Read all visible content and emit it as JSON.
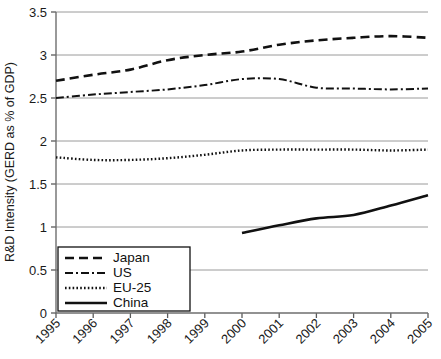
{
  "chart_data": {
    "type": "line",
    "title": "",
    "xlabel": "",
    "ylabel": "R&D Intensity (GERD as % of GDP)",
    "x": [
      1995,
      1996,
      1997,
      1998,
      1999,
      2000,
      2001,
      2002,
      2003,
      2004,
      2005
    ],
    "categories": [
      "1995",
      "1996",
      "1997",
      "1998",
      "1999",
      "2000",
      "2001",
      "2002",
      "2003",
      "2004",
      "2005"
    ],
    "xlim": [
      1995,
      2005
    ],
    "ylim": [
      0,
      3.5
    ],
    "yticks": [
      "0",
      "0.5",
      "1",
      "1.5",
      "2",
      "2.5",
      "3",
      "3.5"
    ],
    "ytick_values": [
      0,
      0.5,
      1,
      1.5,
      2,
      2.5,
      3,
      3.5
    ],
    "grid": "horizontal",
    "legend_position": "lower-left",
    "series": [
      {
        "name": "Japan",
        "dash": "dashed",
        "values": [
          2.7,
          2.77,
          2.83,
          2.94,
          3.0,
          3.04,
          3.12,
          3.17,
          3.2,
          3.22,
          3.2
        ]
      },
      {
        "name": "US",
        "dash": "dash-dot",
        "values": [
          2.5,
          2.54,
          2.57,
          2.6,
          2.65,
          2.72,
          2.72,
          2.62,
          2.61,
          2.6,
          2.61
        ]
      },
      {
        "name": "EU-25",
        "dash": "dotted",
        "values": [
          1.81,
          1.78,
          1.78,
          1.8,
          1.84,
          1.89,
          1.9,
          1.9,
          1.9,
          1.89,
          1.9
        ]
      },
      {
        "name": "China",
        "dash": "solid",
        "values": [
          null,
          null,
          null,
          null,
          null,
          0.93,
          1.02,
          1.1,
          1.14,
          1.25,
          1.37
        ]
      }
    ]
  },
  "legend": {
    "items": [
      {
        "label": "Japan"
      },
      {
        "label": "US"
      },
      {
        "label": "EU-25"
      },
      {
        "label": "China"
      }
    ]
  }
}
